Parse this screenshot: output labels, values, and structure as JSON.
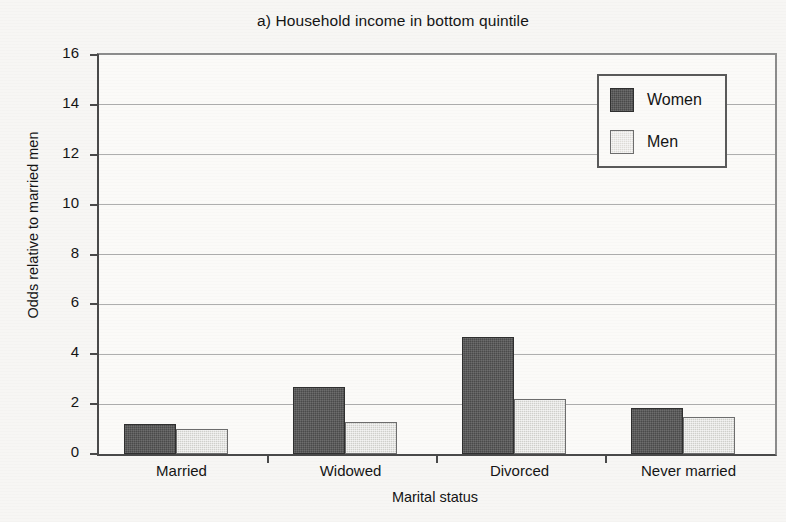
{
  "chart_data": {
    "type": "bar",
    "title": "a) Household income in bottom quintile",
    "xlabel": "Marital status",
    "ylabel": "Odds relative to married men",
    "categories": [
      "Married",
      "Widowed",
      "Divorced",
      "Never married"
    ],
    "series": [
      {
        "name": "Women",
        "color": "#4a4a4a",
        "values": [
          1.2,
          2.7,
          4.7,
          1.85
        ]
      },
      {
        "name": "Men",
        "color": "#cfcfcb",
        "values": [
          1.0,
          1.3,
          2.2,
          1.5
        ]
      }
    ],
    "ylim": [
      0,
      16
    ],
    "ytick_labels": [
      "0",
      "2",
      "4",
      "6",
      "8",
      "10",
      "12",
      "14",
      "16"
    ],
    "ytick_values": [
      0,
      2,
      4,
      6,
      8,
      10,
      12,
      14,
      16
    ],
    "grid": true,
    "legend_position": "top-right",
    "legend_entries": [
      "Women",
      "Men"
    ]
  }
}
